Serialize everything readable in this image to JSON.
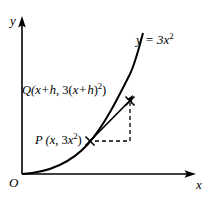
{
  "figure": {
    "background_color": "#ffffff",
    "ink_color": "#000000"
  },
  "axes": {
    "y_label": "y",
    "x_label": "x",
    "origin_label": "O",
    "x_axis": {
      "x_start": 22,
      "x_end": 195,
      "y": 174
    },
    "y_axis": {
      "y_start": 20,
      "y_end": 174,
      "x": 22
    }
  },
  "curve": {
    "equation_label": "y = 3x",
    "equation_exponent": "2",
    "coefficient": 3,
    "power": 2,
    "start_px": {
      "x": 22,
      "y": 174
    },
    "end_px": {
      "x": 143,
      "y": 33
    }
  },
  "points": {
    "p": {
      "name": "P",
      "label_prefix": "P (",
      "label_x": "x",
      "label_sep": ", 3",
      "label_y": "x",
      "label_exponent": "2",
      "label_suffix": ")",
      "marker": "x-cross",
      "px": {
        "x": 90,
        "y": 141
      }
    },
    "q": {
      "name": "Q",
      "label_prefix": "Q(",
      "label_x": "x",
      "label_plus": "+",
      "label_h": "h",
      "label_sep": ", 3(",
      "label_x2": "x",
      "label_plus2": "+",
      "label_h2": "h",
      "label_close": ")",
      "label_exponent": "2",
      "label_suffix": ")",
      "marker": "arrow-cross",
      "px": {
        "x": 130,
        "y": 101
      }
    }
  },
  "secant_line": {
    "name": "secant PQ",
    "from_px": {
      "x": 89,
      "y": 142
    },
    "to_px": {
      "x": 131,
      "y": 100
    }
  },
  "dashed_triangle": {
    "horizontal_run": {
      "x_start": 94,
      "x_end": 130,
      "y": 141
    },
    "vertical_rise": {
      "x": 130,
      "y_start": 141,
      "y_end": 103
    },
    "dash_pattern": "4,3"
  }
}
